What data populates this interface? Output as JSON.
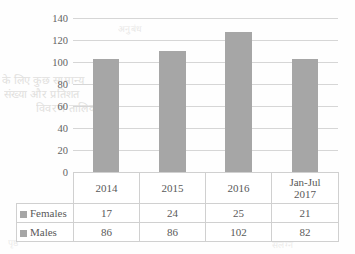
{
  "chart_data": {
    "type": "bar",
    "stacked": true,
    "title": "",
    "xlabel": "",
    "ylabel": "",
    "categories": [
      "2014",
      "2015",
      "2016",
      "Jan-Jul 2017"
    ],
    "series": [
      {
        "name": "Females",
        "values": [
          17,
          24,
          25,
          21
        ],
        "color": "#a6a6a6"
      },
      {
        "name": "Males",
        "values": [
          86,
          86,
          102,
          82
        ],
        "color": "#a6a6a6"
      }
    ],
    "totals": [
      103,
      110,
      127,
      103
    ],
    "ylim": [
      0,
      140
    ],
    "yticks": [
      0,
      20,
      40,
      60,
      80,
      100,
      120,
      140
    ],
    "grid": true,
    "legend_position": "data-table-left",
    "data_table_visible": true
  },
  "axis": {
    "tick_labels": [
      "140",
      "120",
      "100",
      "80",
      "60",
      "40",
      "20",
      "0"
    ]
  },
  "table": {
    "category_headers": [
      {
        "line1": "2014",
        "line2": ""
      },
      {
        "line1": "2015",
        "line2": ""
      },
      {
        "line1": "2016",
        "line2": ""
      },
      {
        "line1": "Jan-Jul",
        "line2": "2017"
      }
    ],
    "rows": [
      {
        "label": "Females",
        "values": [
          "17",
          "24",
          "25",
          "21"
        ]
      },
      {
        "label": "Males",
        "values": [
          "86",
          "86",
          "102",
          "82"
        ]
      }
    ]
  },
  "background_artifacts": {
    "line1": "के लिए कुछ सामान्य",
    "line2": "संख्या और प्रतिशत",
    "line3": "विवरण तालिका",
    "line4": "अनुबंध",
    "line5": "वर्ष",
    "line6": "पृष्ठ",
    "line7": "संलग्न"
  }
}
